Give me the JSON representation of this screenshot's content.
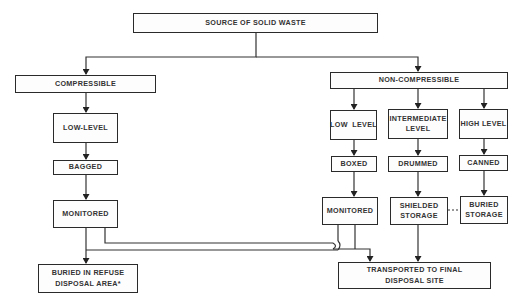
{
  "diagram": {
    "nodes": {
      "source": "SOURCE OF SOLID WASTE",
      "compressible": "COMPRESSIBLE",
      "non_compressible": "NON-COMPRESSIBLE",
      "comp_low_level": "LOW-LEVEL",
      "nc_low_level": "LOW  LEVEL",
      "nc_intermediate": "INTERMEDIATE LEVEL",
      "nc_high_level": "HIGH LEVEL",
      "bagged": "BAGGED",
      "boxed": "BOXED",
      "drummed": "DRUMMED",
      "canned": "CANNED",
      "comp_monitored": "MONITORED",
      "nc_monitored": "MONITORED",
      "shielded_storage": "SHIELDED STORAGE",
      "buried_storage": "BURIED STORAGE",
      "buried_refuse": "BURIED IN REFUSE DISPOSAL AREA*",
      "transported": "TRANSPORTED TO FINAL DISPOSAL SITE"
    },
    "edges": [
      [
        "source",
        "compressible"
      ],
      [
        "source",
        "non_compressible"
      ],
      [
        "compressible",
        "comp_low_level"
      ],
      [
        "comp_low_level",
        "bagged"
      ],
      [
        "bagged",
        "comp_monitored"
      ],
      [
        "comp_monitored",
        "buried_refuse"
      ],
      [
        "comp_monitored",
        "transported"
      ],
      [
        "non_compressible",
        "nc_low_level"
      ],
      [
        "non_compressible",
        "nc_intermediate"
      ],
      [
        "non_compressible",
        "nc_high_level"
      ],
      [
        "nc_low_level",
        "boxed"
      ],
      [
        "nc_intermediate",
        "drummed"
      ],
      [
        "nc_high_level",
        "canned"
      ],
      [
        "boxed",
        "nc_monitored"
      ],
      [
        "drummed",
        "shielded_storage"
      ],
      [
        "canned",
        "buried_storage"
      ],
      [
        "nc_monitored",
        "buried_refuse"
      ],
      [
        "nc_monitored",
        "transported"
      ],
      [
        "shielded_storage",
        "transported"
      ],
      [
        "shielded_storage",
        "buried_storage",
        "dashed"
      ]
    ]
  }
}
